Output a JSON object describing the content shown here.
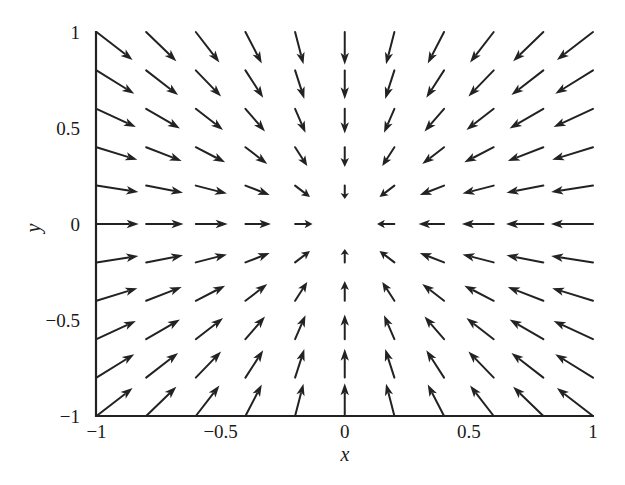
{
  "chart_data": {
    "type": "quiver",
    "title": "",
    "xlabel": "x",
    "ylabel": "y",
    "xlim": [
      -1,
      1
    ],
    "ylim": [
      -1,
      1
    ],
    "xticks": [
      -1,
      -0.5,
      0,
      0.5,
      1
    ],
    "xtick_labels": [
      "−1",
      "−0.5",
      "0",
      "0.5",
      "1"
    ],
    "yticks": [
      -1,
      -0.5,
      0,
      0.5,
      1
    ],
    "ytick_labels": [
      "−1",
      "−0.5",
      "0",
      "0.5",
      "1"
    ],
    "grid": false,
    "legend": null,
    "field": {
      "description": "Sink vector field: arrows point toward the origin, (u, v) = (-x, -y) direction; arrow length grows sub-linearly with distance from origin",
      "u_expr": "-x",
      "v_expr": "-y",
      "grid_x": [
        -1,
        -0.8,
        -0.6,
        -0.4,
        -0.2,
        0,
        0.2,
        0.4,
        0.6,
        0.8,
        1
      ],
      "grid_y": [
        -1,
        -0.8,
        -0.6,
        -0.4,
        -0.2,
        0,
        0.2,
        0.4,
        0.6,
        0.8,
        1
      ],
      "omitted_points": [
        [
          0,
          0
        ]
      ],
      "arrow_length_scale": 0.17,
      "arrow_length_exponent": 0.55
    },
    "colors": {
      "arrow": "#222222",
      "axis": "#222222",
      "text": "#1a1a1a",
      "background": "#ffffff"
    }
  }
}
